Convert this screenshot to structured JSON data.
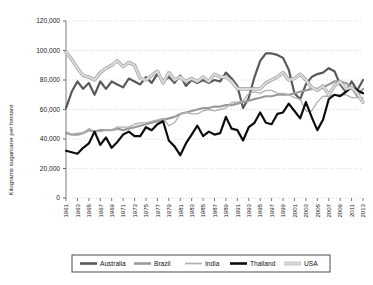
{
  "chart_data": {
    "type": "line",
    "title": "",
    "subtitle": "",
    "xlabel": "",
    "ylabel": "Kilograms sugarcane per hectare",
    "xlim": [
      1961,
      2013
    ],
    "ylim": [
      0,
      120000
    ],
    "grid": true,
    "grid_style": "dotted horizontal gridlines",
    "legend_position": "bottom",
    "ytick_labels": [
      "0",
      "20,000",
      "40,000",
      "60,000",
      "80,000",
      "100,000",
      "120,000"
    ],
    "ytick_values": [
      0,
      20000,
      40000,
      60000,
      80000,
      100000,
      120000
    ],
    "xtick_labels": [
      "1961",
      "1963",
      "1965",
      "1967",
      "1969",
      "1971",
      "1973",
      "1975",
      "1977",
      "1979",
      "1981",
      "1983",
      "1985",
      "1987",
      "1989",
      "1991",
      "1993",
      "1995",
      "1997",
      "1999",
      "2001",
      "2003",
      "2005",
      "2007",
      "2009",
      "2011",
      "2013"
    ],
    "x": [
      1961,
      1962,
      1963,
      1964,
      1965,
      1966,
      1967,
      1968,
      1969,
      1970,
      1971,
      1972,
      1973,
      1974,
      1975,
      1976,
      1977,
      1978,
      1979,
      1980,
      1981,
      1982,
      1983,
      1984,
      1985,
      1986,
      1987,
      1988,
      1989,
      1990,
      1991,
      1992,
      1993,
      1994,
      1995,
      1996,
      1997,
      1998,
      1999,
      2000,
      2001,
      2002,
      2003,
      2004,
      2005,
      2006,
      2007,
      2008,
      2009,
      2010,
      2011,
      2012,
      2013
    ],
    "series": [
      {
        "name": "Australia",
        "color": "#595959",
        "width": 2.2,
        "values": [
          61000,
          72000,
          79000,
          74000,
          78000,
          70000,
          79000,
          74000,
          79000,
          77000,
          75000,
          81000,
          79000,
          77000,
          82000,
          78000,
          84000,
          79000,
          82000,
          78000,
          83000,
          76000,
          80000,
          78000,
          80000,
          78000,
          80000,
          79000,
          85000,
          81000,
          76000,
          61000,
          68000,
          82000,
          93000,
          98000,
          98000,
          97000,
          95000,
          87000,
          71000,
          67000,
          77000,
          82000,
          84000,
          85000,
          88000,
          86000,
          77000,
          72000,
          79000,
          73000,
          80000
        ]
      },
      {
        "name": "Brazil",
        "color": "#9a9a9a",
        "width": 2.2,
        "values": [
          44000,
          43000,
          43000,
          44000,
          46000,
          45000,
          46000,
          46000,
          46000,
          47000,
          46000,
          47000,
          48000,
          49000,
          50000,
          51000,
          52000,
          53000,
          54000,
          55000,
          57000,
          58000,
          59000,
          60000,
          61000,
          61000,
          62000,
          62000,
          63000,
          63000,
          64000,
          65000,
          66000,
          67000,
          68000,
          69000,
          69000,
          70000,
          70000,
          70000,
          71000,
          72000,
          73000,
          74000,
          74000,
          75000,
          77000,
          79000,
          79000,
          78000,
          75000,
          69000,
          74000
        ]
      },
      {
        "name": "India",
        "color": "#b0b0b0",
        "width": 1.3,
        "values": [
          45000,
          43000,
          44000,
          44000,
          47000,
          45000,
          45000,
          46000,
          46000,
          48000,
          48000,
          48000,
          50000,
          51000,
          51000,
          52000,
          53000,
          54000,
          49000,
          51000,
          57000,
          58000,
          57000,
          57000,
          59000,
          60000,
          59000,
          60000,
          61000,
          65000,
          65000,
          66000,
          71000,
          72000,
          71000,
          73000,
          73000,
          71000,
          71000,
          70000,
          68000,
          67000,
          59000,
          59000,
          65000,
          69000,
          69000,
          70000,
          70000,
          70000,
          68000,
          68000,
          68000
        ]
      },
      {
        "name": "Thailand",
        "color": "#0d0d0d",
        "width": 2.2,
        "values": [
          32000,
          31000,
          30000,
          34000,
          37000,
          45000,
          36000,
          41000,
          34000,
          38000,
          43000,
          45000,
          42000,
          42000,
          48000,
          46000,
          50000,
          52000,
          39000,
          35000,
          29000,
          37000,
          43000,
          49000,
          42000,
          45000,
          43000,
          44000,
          55000,
          47000,
          46000,
          39000,
          48000,
          51000,
          58000,
          51000,
          50000,
          57000,
          58000,
          64000,
          59000,
          54000,
          65000,
          55000,
          46000,
          53000,
          67000,
          70000,
          69000,
          72000,
          75000,
          73000,
          71000
        ]
      },
      {
        "name": "USA",
        "color": "#d8d8d8",
        "stroke": "#8a8a8a",
        "width": 2.4,
        "values": [
          99000,
          94000,
          88000,
          83000,
          82000,
          80000,
          85000,
          88000,
          90000,
          93000,
          89000,
          92000,
          90000,
          81000,
          80000,
          83000,
          86000,
          78000,
          85000,
          80000,
          82000,
          79000,
          81000,
          79000,
          82000,
          79000,
          84000,
          82000,
          82000,
          79000,
          74000,
          74000,
          74000,
          74000,
          74000,
          78000,
          80000,
          82000,
          85000,
          80000,
          81000,
          84000,
          80000,
          75000,
          73000,
          76000,
          70000,
          76000,
          79000,
          74000,
          75000,
          71000,
          65000
        ]
      }
    ]
  },
  "axis": {
    "y_label_text": "Kilograms sugarcane per hectare"
  },
  "legend": {
    "items": [
      {
        "label": "Australia"
      },
      {
        "label": "Brazil"
      },
      {
        "label": "India"
      },
      {
        "label": "Thailand"
      },
      {
        "label": "USA"
      }
    ]
  }
}
